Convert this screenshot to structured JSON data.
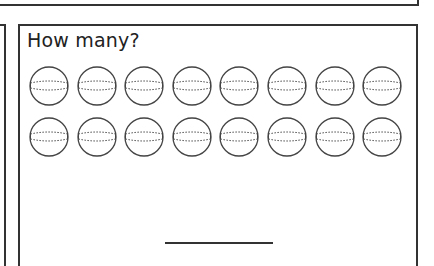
{
  "worksheet": {
    "question": "How many?",
    "rows": 2,
    "columns": 8,
    "item_icon": "ball-icon",
    "total_items": 16,
    "answer_value": ""
  },
  "colors": {
    "border": "#333333",
    "stroke": "#444444",
    "background": "#ffffff"
  }
}
